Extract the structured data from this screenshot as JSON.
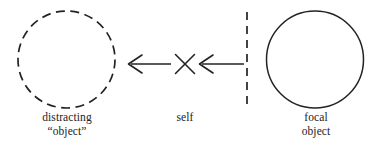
{
  "figure": {
    "background_color": "#ffffff",
    "stroke_color": "#232323",
    "elements": {
      "distracting_circle": {
        "name": "dashed-circle",
        "style": "dashed",
        "cx": 66.5,
        "cy": 59.5,
        "r": 48.5
      },
      "focal_circle": {
        "name": "solid-circle",
        "style": "solid",
        "cx": 315,
        "cy": 59.5,
        "r": 48.5
      },
      "divider": {
        "name": "vertical-dashed-line",
        "style": "dashed",
        "x": 247,
        "y1": 12,
        "y2": 106
      },
      "arrow_left": {
        "name": "left-pointing-arrow-to-distracting",
        "direction": "left",
        "x_from": 171,
        "x_to": 128,
        "y": 64
      },
      "arrow_right": {
        "name": "left-pointing-arrow-from-divider",
        "direction": "left",
        "x_from": 244,
        "x_to": 199,
        "y": 64
      },
      "cross": {
        "name": "x-mark-self",
        "cx": 185,
        "cy": 64,
        "size": 11
      }
    }
  },
  "labels": {
    "distracting": {
      "line1": "distracting",
      "line2": "“object”"
    },
    "self": {
      "line1": "self"
    },
    "focal": {
      "line1": "focal",
      "line2": "object"
    }
  }
}
